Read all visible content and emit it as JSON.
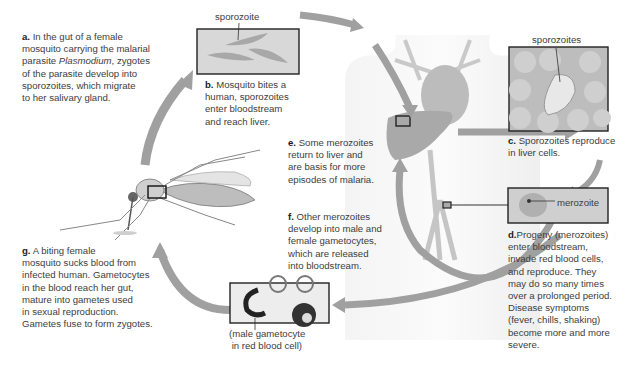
{
  "steps": {
    "a": {
      "letter": "a.",
      "lines": [
        "In the gut of a female",
        "mosquito carrying the malarial",
        "parasite ",
        "Plasmodium",
        ", zygotes",
        "of the parasite develop into",
        "sporozoites, which migrate",
        "to her salivary gland."
      ]
    },
    "b": {
      "letter": "b.",
      "lines": [
        "Mosquito bites a",
        "human, sporozoites",
        "enter bloodstream",
        "and reach liver."
      ]
    },
    "c": {
      "letter": "c.",
      "lines": [
        "Sporozoites reproduce",
        "in liver cells."
      ]
    },
    "d": {
      "letter": "d.",
      "lines": [
        "Progeny (merozoites)",
        "enter bloodstream,",
        "invade red blood cells,",
        "and reproduce. They",
        "may do so many times",
        "over a prolonged period.",
        "Disease symptoms",
        "(fever, chills, shaking)",
        "become more and more",
        "severe."
      ]
    },
    "e": {
      "letter": "e.",
      "lines": [
        "Some merozoites",
        "return to liver and",
        "are basis for more",
        "episodes of malaria."
      ]
    },
    "f": {
      "letter": "f.",
      "lines": [
        "Other merozoites",
        "develop into male and",
        "female gametocytes,",
        "which are released",
        "into bloodstream."
      ]
    },
    "g": {
      "letter": "g.",
      "lines": [
        "A biting female",
        "mosquito sucks blood from",
        "infected human. Gametocytes",
        "in the blood reach her gut,",
        "mature into gametes used",
        "in sexual reproduction.",
        "Gametes fuse to form zygotes."
      ]
    }
  },
  "labels": {
    "sporozoite": "sporozoite",
    "sporozoites": "sporozoites",
    "merozoite": "merozoite",
    "gametocyte_1": "(male gametocyte",
    "gametocyte_2": "in red blood cell)"
  },
  "colors": {
    "arrow": "#9a9a9a",
    "panel_bg": "#d6d6d6",
    "panel_border": "#222222",
    "text": "#3d3d3d"
  }
}
